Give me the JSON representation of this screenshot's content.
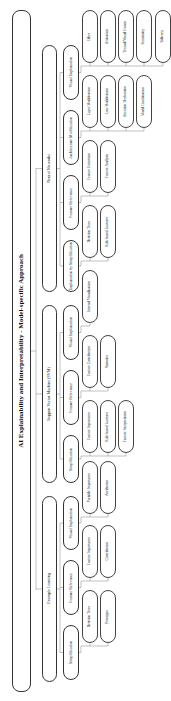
{
  "title": "AI Explainability and Interpretability - Model-specific Approach",
  "categories": [
    {
      "label": "Neural Networks",
      "methods": [
        {
          "label": "Visual Explanation",
          "techniques": [
            "Filter",
            "Activation",
            "Textual/Visual Fusion",
            "Sensitivity",
            "Saliency"
          ]
        },
        {
          "label": "Architecture Modification",
          "techniques": [
            "Layer Modification",
            "Loss Modification",
            "Attention Mechanism",
            "Model Combination"
          ]
        },
        {
          "label": "Feature Relevance",
          "techniques": [
            "Feature Extraction",
            "Feature Analysis"
          ]
        },
        {
          "label": "Explanation by Simplification",
          "techniques": [
            "Decision Trees",
            "Rule-based Learners"
          ]
        }
      ]
    },
    {
      "label": "Support Vector Machine (SVM)",
      "methods": [
        {
          "label": "Visual Explanation",
          "techniques": [
            "Internal Visualization"
          ]
        },
        {
          "label": "Feature Relevance",
          "techniques": [
            "Feature Contribution",
            "Statistics"
          ]
        },
        {
          "label": "Simplification",
          "techniques": [
            "Feature Importance",
            "Rule-based Learners",
            "Feature Interpretation"
          ]
        }
      ]
    },
    {
      "label": "Example Learning",
      "methods": [
        {
          "label": "Visual Explanation",
          "techniques": [
            "Variable Importance",
            "Attribution"
          ]
        },
        {
          "label": "Feature Relevance",
          "techniques": [
            "Feature Importance",
            "Contribution"
          ]
        },
        {
          "label": "Simplification",
          "techniques": [
            "Decision Trees",
            "Prototype"
          ]
        }
      ]
    }
  ]
}
